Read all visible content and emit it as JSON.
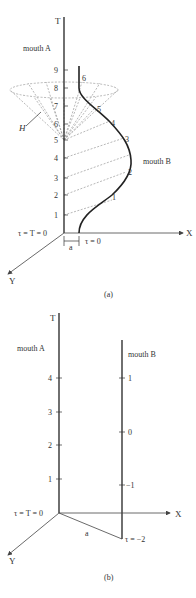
{
  "figure_a": {
    "caption": "(a)",
    "axes": {
      "t_label": "T",
      "x_label": "X",
      "y_label": "Y",
      "origin_label": "τ = T = 0"
    },
    "mouth_a_label": "mouth A",
    "mouth_b_label": "mouth B",
    "t_ticks": [
      "0",
      "1",
      "2",
      "3",
      "4",
      "5",
      "6",
      "7",
      "8",
      "9"
    ],
    "tau_ticks": [
      "1",
      "2",
      "3",
      "4",
      "5",
      "6"
    ],
    "tau_start_label": "τ = 0",
    "separation_label": "a",
    "horizon_label": "H"
  },
  "figure_b": {
    "caption": "(b)",
    "axes": {
      "t_label": "T",
      "x_label": "X",
      "y_label": "Y",
      "origin_label": "τ = T = 0"
    },
    "mouth_a_label": "mouth A",
    "mouth_b_label": "mouth B",
    "t_ticks": [
      "1",
      "2",
      "3",
      "4"
    ],
    "tau_ticks": [
      "1",
      "0",
      "−1"
    ],
    "tau_end_label": "τ = −2",
    "separation_label": "a"
  }
}
